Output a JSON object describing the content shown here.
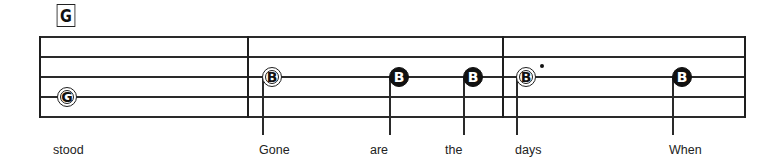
{
  "chord": {
    "label": "G"
  },
  "staff": {
    "lines_y": [
      37,
      57,
      77,
      97,
      117
    ],
    "left_x": 39,
    "right_x": 745,
    "barlines_x": [
      248,
      503
    ]
  },
  "notes": [
    {
      "letter": "G",
      "style": "open",
      "cx": 67,
      "cy": 97,
      "stem": false,
      "dotted": false
    },
    {
      "letter": "B",
      "style": "open",
      "cx": 272,
      "cy": 77,
      "stem": true,
      "stem_x": 262,
      "dotted": false
    },
    {
      "letter": "B",
      "style": "filled",
      "cx": 399,
      "cy": 77,
      "stem": true,
      "stem_x": 389,
      "dotted": false
    },
    {
      "letter": "B",
      "style": "filled",
      "cx": 473,
      "cy": 77,
      "stem": true,
      "stem_x": 463,
      "dotted": false
    },
    {
      "letter": "B",
      "style": "open",
      "cx": 526,
      "cy": 77,
      "stem": true,
      "stem_x": 516,
      "dotted": true
    },
    {
      "letter": "B",
      "style": "filled",
      "cx": 682,
      "cy": 77,
      "stem": true,
      "stem_x": 672,
      "dotted": false
    }
  ],
  "lyrics": [
    {
      "text": "stood",
      "x": 53
    },
    {
      "text": "Gone",
      "x": 259
    },
    {
      "text": "are",
      "x": 370
    },
    {
      "text": "the",
      "x": 445
    },
    {
      "text": "days",
      "x": 515
    },
    {
      "text": "When",
      "x": 669
    }
  ]
}
